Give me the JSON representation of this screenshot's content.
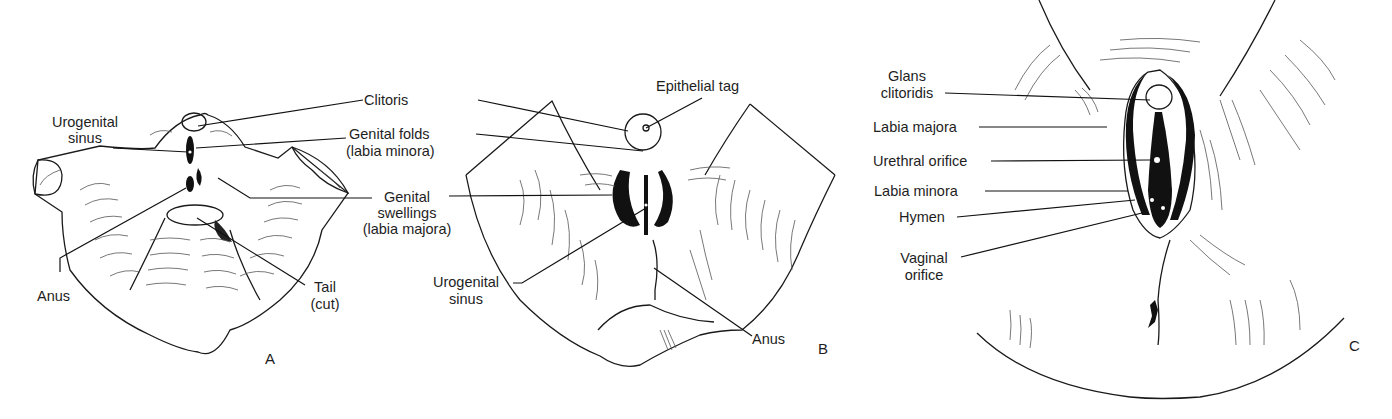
{
  "figure": {
    "panels": [
      {
        "id": "A",
        "letter": "A",
        "labels": {
          "clitoris": "Clitoris",
          "urogenital_sinus_1": "Urogenital",
          "urogenital_sinus_2": "sinus",
          "genital_folds_1": "Genital folds",
          "genital_folds_2": "(labia minora)",
          "genital_swellings_1": "Genital",
          "genital_swellings_2": "swellings",
          "genital_swellings_3": "(labia majora)",
          "anus": "Anus",
          "tail_1": "Tail",
          "tail_2": "(cut)"
        }
      },
      {
        "id": "B",
        "letter": "B",
        "labels": {
          "epithelial_tag": "Epithelial tag",
          "urogenital_sinus_1": "Urogenital",
          "urogenital_sinus_2": "sinus",
          "anus": "Anus"
        }
      },
      {
        "id": "C",
        "letter": "C",
        "labels": {
          "glans_1": "Glans",
          "glans_2": "clitoridis",
          "labia_majora": "Labia majora",
          "urethral_orifice": "Urethral orifice",
          "labia_minora": "Labia minora",
          "hymen": "Hymen",
          "vaginal_orifice_1": "Vaginal",
          "vaginal_orifice_2": "orifice"
        }
      }
    ]
  }
}
